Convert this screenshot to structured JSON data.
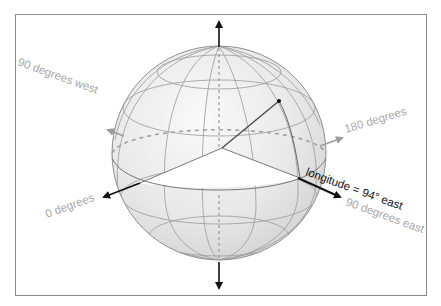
{
  "diagram": {
    "labels": {
      "west_90": "90 degrees west",
      "deg_180": "180 degrees",
      "deg_0": "0 degrees",
      "longitude": "longitude = 94° east",
      "east_90": "90 degrees east"
    },
    "colors": {
      "frame": "#8a8a8a",
      "sphere_fill": "#e6e6e6",
      "grid_line": "#9a9a9a",
      "axis_dark": "#111111",
      "axis_grey": "#9e9e9e",
      "label_grey": "#a8a8a8",
      "label_dark": "#111111"
    },
    "values": {
      "longitude_degrees": 94,
      "longitude_direction": "east"
    }
  }
}
